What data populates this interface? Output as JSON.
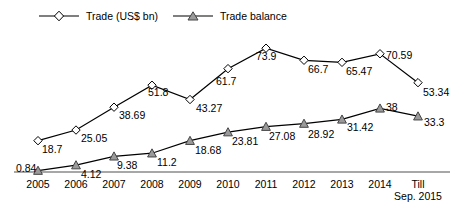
{
  "legend": {
    "entries": [
      {
        "label": "Trade (US$ bn)",
        "marker": "diamond-open-marker",
        "color": "#000000"
      },
      {
        "label": "Trade balance",
        "marker": "triangle-filled-marker",
        "color": "#808080"
      }
    ]
  },
  "axis": {
    "labels": [
      {
        "line1": "2005",
        "line2": ""
      },
      {
        "line1": "2006",
        "line2": ""
      },
      {
        "line1": "2007",
        "line2": ""
      },
      {
        "line1": "2008",
        "line2": ""
      },
      {
        "line1": "2009",
        "line2": ""
      },
      {
        "line1": "2010",
        "line2": ""
      },
      {
        "line1": "2011",
        "line2": ""
      },
      {
        "line1": "2012",
        "line2": ""
      },
      {
        "line1": "2013",
        "line2": ""
      },
      {
        "line1": "2014",
        "line2": ""
      },
      {
        "line1": "Till",
        "line2": "Sep. 2015"
      }
    ]
  },
  "chart_data": {
    "type": "line",
    "title": "",
    "xlabel": "",
    "ylabel": "",
    "grid": false,
    "legend_position": "top-left",
    "axis_visible": {
      "x": true,
      "y": false
    },
    "categories": [
      "2005",
      "2006",
      "2007",
      "2008",
      "2009",
      "2010",
      "2011",
      "2012",
      "2013",
      "2014",
      "Till Sep. 2015"
    ],
    "ylim": [
      0,
      80
    ],
    "series": [
      {
        "name": "Trade (US$ bn)",
        "marker": "diamond-open",
        "color": "#000000",
        "values": [
          18.7,
          25.05,
          38.69,
          51.8,
          43.27,
          61.7,
          73.9,
          66.7,
          65.47,
          70.59,
          53.34
        ],
        "labels": [
          "18.7",
          "25.05",
          "38.69",
          "51.8",
          "43.27",
          "61.7",
          "73.9",
          "66.7",
          "65.47",
          "70.59",
          "53.34"
        ]
      },
      {
        "name": "Trade balance",
        "marker": "triangle-filled",
        "color": "#808080",
        "values": [
          0.84,
          4.12,
          9.38,
          11.2,
          18.68,
          23.81,
          27.08,
          28.92,
          31.42,
          38,
          33.3
        ],
        "labels": [
          "0.84",
          "4.12",
          "9.38",
          "11.2",
          "18.68",
          "23.81",
          "27.08",
          "28.92",
          "31.42",
          "38",
          "33.3"
        ]
      }
    ]
  }
}
